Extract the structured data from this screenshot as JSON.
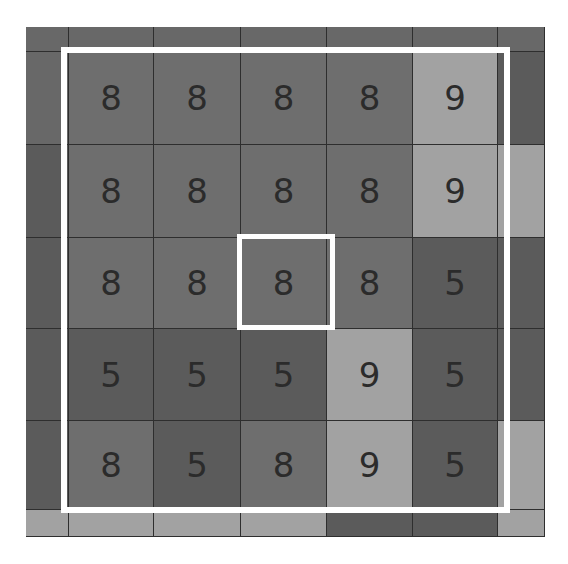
{
  "caption": {
    "text": "g y g",
    "note_visible": "cropped descenders only"
  },
  "colors": {
    "light": "#a2a2a2",
    "mid": "#6e6e6e",
    "dark": "#5b5b5b",
    "digit": "#2b2b2b",
    "frame": "#ffffff",
    "gridline": "#2e2e2e"
  },
  "board": {
    "columns_px": [
      26,
      69,
      154,
      241,
      327,
      413,
      498,
      545
    ],
    "rows_px": [
      27,
      52,
      145,
      238,
      329,
      421,
      510,
      537
    ],
    "cells": [
      [
        {
          "v": "",
          "s": "edge"
        },
        {
          "v": "",
          "s": "edge"
        },
        {
          "v": "",
          "s": "edge"
        },
        {
          "v": "",
          "s": "edge"
        },
        {
          "v": "",
          "s": "edge"
        },
        {
          "v": "",
          "s": "edge"
        },
        {
          "v": "",
          "s": "edge"
        }
      ],
      [
        {
          "v": "",
          "s": "edge"
        },
        {
          "v": "8",
          "s": "mid"
        },
        {
          "v": "8",
          "s": "mid"
        },
        {
          "v": "8",
          "s": "mid"
        },
        {
          "v": "8",
          "s": "mid"
        },
        {
          "v": "9",
          "s": "light"
        },
        {
          "v": "",
          "s": "dark"
        }
      ],
      [
        {
          "v": "",
          "s": "dark"
        },
        {
          "v": "8",
          "s": "mid"
        },
        {
          "v": "8",
          "s": "mid"
        },
        {
          "v": "8",
          "s": "mid"
        },
        {
          "v": "8",
          "s": "mid"
        },
        {
          "v": "9",
          "s": "light"
        },
        {
          "v": "",
          "s": "light"
        }
      ],
      [
        {
          "v": "",
          "s": "dark"
        },
        {
          "v": "8",
          "s": "mid"
        },
        {
          "v": "8",
          "s": "mid"
        },
        {
          "v": "8",
          "s": "mid"
        },
        {
          "v": "8",
          "s": "mid"
        },
        {
          "v": "5",
          "s": "dark"
        },
        {
          "v": "",
          "s": "dark"
        }
      ],
      [
        {
          "v": "",
          "s": "dark"
        },
        {
          "v": "5",
          "s": "dark"
        },
        {
          "v": "5",
          "s": "dark"
        },
        {
          "v": "5",
          "s": "dark"
        },
        {
          "v": "9",
          "s": "light"
        },
        {
          "v": "5",
          "s": "dark"
        },
        {
          "v": "",
          "s": "dark"
        }
      ],
      [
        {
          "v": "",
          "s": "dark"
        },
        {
          "v": "8",
          "s": "mid"
        },
        {
          "v": "5",
          "s": "dark"
        },
        {
          "v": "8",
          "s": "mid"
        },
        {
          "v": "9",
          "s": "light"
        },
        {
          "v": "5",
          "s": "dark"
        },
        {
          "v": "",
          "s": "light"
        }
      ],
      [
        {
          "v": "",
          "s": "light"
        },
        {
          "v": "",
          "s": "light"
        },
        {
          "v": "",
          "s": "light"
        },
        {
          "v": "",
          "s": "light"
        },
        {
          "v": "",
          "s": "dark"
        },
        {
          "v": "",
          "s": "dark"
        },
        {
          "v": "",
          "s": "light"
        }
      ]
    ],
    "visible_grid_5x5": [
      [
        "8",
        "8",
        "8",
        "8",
        "9"
      ],
      [
        "8",
        "8",
        "8",
        "8",
        "9"
      ],
      [
        "8",
        "8",
        "8",
        "8",
        "5"
      ],
      [
        "5",
        "5",
        "5",
        "9",
        "5"
      ],
      [
        "8",
        "5",
        "8",
        "9",
        "5"
      ]
    ],
    "outer_selection": {
      "label": "5x5 window",
      "rows": [
        1,
        5
      ],
      "cols": [
        1,
        5
      ]
    },
    "center_selection": {
      "label": "center cell",
      "row": 3,
      "col": 3,
      "value": "8"
    }
  }
}
